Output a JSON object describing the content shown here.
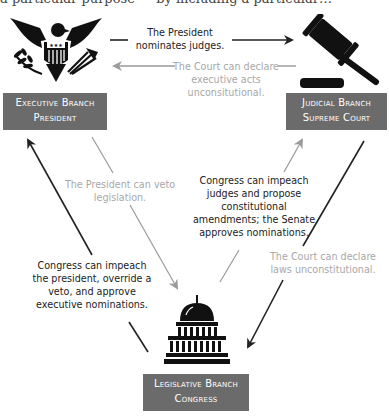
{
  "header_clipped_text": "a particular purpose — by including a particular…",
  "branches": {
    "executive": {
      "line1": "Executive Branch",
      "line2": "President",
      "icon": "eagle-seal-icon"
    },
    "judicial": {
      "line1": "Judicial Branch",
      "line2": "Supreme Court",
      "icon": "gavel-icon"
    },
    "legislative": {
      "line1": "Legislative Branch",
      "line2": "Congress",
      "icon": "capitol-icon"
    }
  },
  "relations": {
    "exec_to_judicial": {
      "line1": "The President",
      "line2": "nominates judges."
    },
    "judicial_to_exec": {
      "line1": "The Court can declare",
      "line2": "executive acts",
      "line3": "unconsitutional."
    },
    "exec_to_legislative": {
      "line1": "The President can veto",
      "line2": "legislation."
    },
    "legislative_to_judicial": {
      "line1": "Congress can impeach",
      "line2": "judges and propose",
      "line3": "constitutional",
      "line4": "amendments; the Senate",
      "line5": "approves nominations."
    },
    "legislative_to_exec": {
      "line1": "Congress can impeach",
      "line2": "the president, override a",
      "line3": "veto, and approve",
      "line4": "executive nominations."
    },
    "judicial_to_legislative": {
      "line1": "The Court can declare",
      "line2": "laws unconstitutional."
    }
  },
  "colors": {
    "box": "#6b6b6b",
    "dark_arrow": "#222222",
    "light_arrow": "#9a9a9a"
  }
}
